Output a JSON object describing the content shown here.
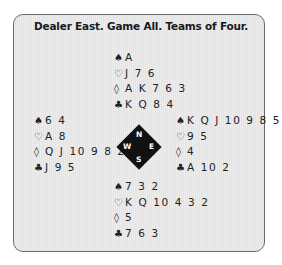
{
  "title": "Dealer East. Game All. Teams of Four.",
  "icons": {
    "spade": "♠",
    "heart": "♡",
    "diamond": "◊",
    "club": "♣"
  },
  "compass": {
    "n": "N",
    "s": "S",
    "w": "W",
    "e": "E"
  },
  "hands": {
    "north": {
      "spades": "A",
      "hearts": "J 7 6",
      "diamonds": "A K 7 6 3",
      "clubs": "K Q 8 4"
    },
    "west": {
      "spades": "6 4",
      "hearts": "A 8",
      "diamonds": "Q J 10 9 8 2",
      "clubs": "J 9 5"
    },
    "east": {
      "spades": "K Q J 10 9 8 5",
      "hearts": "9 5",
      "diamonds": "4",
      "clubs": "A 10 2"
    },
    "south": {
      "spades": "7 3 2",
      "hearts": "K Q 10 4 3 2",
      "diamonds": "5",
      "clubs": "7 6 3"
    }
  },
  "colors": {
    "panel_bg": "#e8e8e8",
    "border": "#6a6a6a",
    "text": "#1a1a1a"
  }
}
